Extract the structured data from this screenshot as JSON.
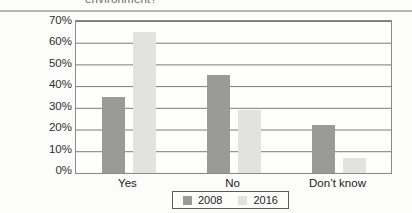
{
  "header": {
    "clipped_text": "environment?"
  },
  "chart_data": {
    "type": "bar",
    "categories": [
      "Yes",
      "No",
      "Don’t know"
    ],
    "series": [
      {
        "name": "2008",
        "color": "#9a9a98",
        "values": [
          35,
          45,
          22
        ]
      },
      {
        "name": "2016",
        "color": "#e2e2e0",
        "values": [
          65,
          29,
          7
        ]
      }
    ],
    "y_ticks": [
      "70%",
      "60%",
      "50%",
      "40%",
      "30%",
      "20%",
      "10%",
      "0%"
    ],
    "ylim": [
      0,
      70
    ],
    "grid": true,
    "legend_position": "bottom",
    "gridline_color": "#787876",
    "plot_border_color": "#8a8a88"
  }
}
